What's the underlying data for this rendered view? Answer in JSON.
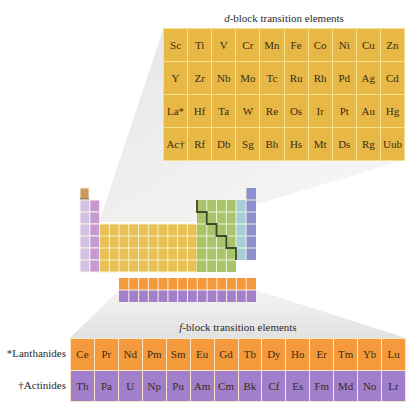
{
  "d_block": {
    "title_prefix": "d",
    "title_rest": "-block transition elements",
    "rows": [
      [
        "Sc",
        "Ti",
        "V",
        "Cr",
        "Mn",
        "Fe",
        "Co",
        "Ni",
        "Cu",
        "Zn"
      ],
      [
        "Y",
        "Zr",
        "Nb",
        "Mo",
        "Tc",
        "Ru",
        "Rh",
        "Pd",
        "Ag",
        "Cd"
      ],
      [
        "La*",
        "Hf",
        "Ta",
        "W",
        "Re",
        "Os",
        "Ir",
        "Pt",
        "Au",
        "Hg"
      ],
      [
        "Ac†",
        "Rf",
        "Db",
        "Sg",
        "Bh",
        "Hs",
        "Mt",
        "Ds",
        "Rg",
        "Uub"
      ]
    ],
    "color": "#e8b847"
  },
  "f_block": {
    "title_prefix": "f",
    "title_rest": "-block transition elements",
    "lanthanides_label": "*Lanthanides",
    "actinides_label": "†Actinides",
    "lanthanides": [
      "Ce",
      "Pr",
      "Nd",
      "Pm",
      "Sm",
      "Eu",
      "Gd",
      "Tb",
      "Dy",
      "Ho",
      "Er",
      "Tm",
      "Yb",
      "Lu"
    ],
    "actinides": [
      "Th",
      "Pa",
      "U",
      "Np",
      "Pu",
      "Am",
      "Cm",
      "Bk",
      "Cf",
      "Es",
      "Fm",
      "Md",
      "No",
      "Lr"
    ],
    "lanthanide_color": "#f59a3c",
    "actinide_color": "#a17fca"
  },
  "mini_table": {
    "colors": {
      "hydrogen": "#c99a5c",
      "group1": "#d4c1e6",
      "group2": "#c79ad6",
      "d_block": "#e8c155",
      "p_block": "#a9c46a",
      "group17": "#a9cfd6",
      "group18": "#8c8fd0",
      "lanthanides": "#f59a3c",
      "actinides": "#a17fca"
    }
  }
}
